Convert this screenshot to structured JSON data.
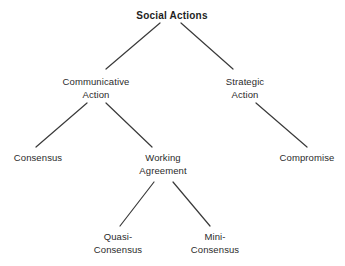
{
  "diagram": {
    "title": "Social Actions",
    "background_color": "#ffffff",
    "text_color": "#2b2b2b",
    "edge_color": "#3a3a3a",
    "nodes": [
      {
        "id": "social-actions",
        "label": "Social Actions",
        "level": 1,
        "x": 172,
        "y": 10,
        "bold": true
      },
      {
        "id": "communicative-action",
        "label": "Communicative\nAction",
        "level": 2,
        "x": 96,
        "y": 76,
        "bold": false
      },
      {
        "id": "strategic-action",
        "label": "Strategic\nAction",
        "level": 2,
        "x": 245,
        "y": 76,
        "bold": false
      },
      {
        "id": "consensus",
        "label": "Consensus",
        "level": 3,
        "x": 38,
        "y": 152,
        "bold": false
      },
      {
        "id": "working-agreement",
        "label": "Working\nAgreement",
        "level": 3,
        "x": 163,
        "y": 152,
        "bold": false
      },
      {
        "id": "compromise",
        "label": "Compromise",
        "level": 3,
        "x": 307,
        "y": 152,
        "bold": false
      },
      {
        "id": "quasi-consensus",
        "label": "Quasi-\nConsensus",
        "level": 4,
        "x": 118,
        "y": 231,
        "bold": false
      },
      {
        "id": "mini-consensus",
        "label": "Mini-\nConsensus",
        "level": 4,
        "x": 215,
        "y": 231,
        "bold": false
      }
    ],
    "edges": [
      {
        "id": "edge-social-to-communicative",
        "from": "social-actions",
        "to": "communicative-action",
        "x1": 160,
        "y1": 23,
        "x2": 106,
        "y2": 69
      },
      {
        "id": "edge-social-to-strategic",
        "from": "social-actions",
        "to": "strategic-action",
        "x1": 181,
        "y1": 23,
        "x2": 233,
        "y2": 69
      },
      {
        "id": "edge-communicative-to-consensus",
        "from": "communicative-action",
        "to": "consensus",
        "x1": 87,
        "y1": 103,
        "x2": 36,
        "y2": 147
      },
      {
        "id": "edge-communicative-to-working",
        "from": "communicative-action",
        "to": "working-agreement",
        "x1": 106,
        "y1": 103,
        "x2": 152,
        "y2": 147
      },
      {
        "id": "edge-strategic-to-compromise",
        "from": "strategic-action",
        "to": "compromise",
        "x1": 256,
        "y1": 103,
        "x2": 307,
        "y2": 147
      },
      {
        "id": "edge-working-to-quasi",
        "from": "working-agreement",
        "to": "quasi-consensus",
        "x1": 154,
        "y1": 182,
        "x2": 120,
        "y2": 226
      },
      {
        "id": "edge-working-to-mini",
        "from": "working-agreement",
        "to": "mini-consensus",
        "x1": 173,
        "y1": 182,
        "x2": 210,
        "y2": 226
      }
    ]
  }
}
